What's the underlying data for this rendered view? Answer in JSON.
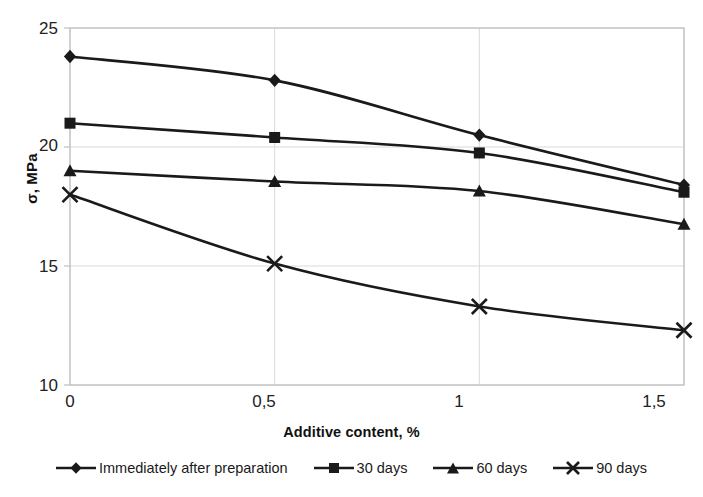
{
  "chart_data": {
    "type": "line",
    "title": "",
    "xlabel": "Additive content, %",
    "ylabel": "σ, MPa",
    "x": [
      0,
      0.5,
      1,
      1.5
    ],
    "xtick_labels": [
      "0",
      "0,5",
      "1",
      "1,5"
    ],
    "ytick_labels": [
      "10",
      "15",
      "20",
      "25"
    ],
    "yticks": [
      10,
      15,
      20,
      25
    ],
    "xlim": [
      0,
      1.5
    ],
    "ylim": [
      10,
      25
    ],
    "grid": true,
    "legend_position": "bottom",
    "series": [
      {
        "name": "Immediately after preparation",
        "marker": "diamond",
        "values": [
          23.8,
          22.8,
          20.5,
          18.4
        ]
      },
      {
        "name": "30 days",
        "marker": "square",
        "values": [
          21.0,
          20.4,
          19.75,
          18.1
        ]
      },
      {
        "name": "60 days",
        "marker": "triangle",
        "values": [
          19.0,
          18.55,
          18.15,
          16.75
        ]
      },
      {
        "name": "90 days",
        "marker": "x-cross",
        "values": [
          18.0,
          15.1,
          13.3,
          12.3
        ]
      }
    ],
    "colors": {
      "line": "#1a1a1a",
      "grid": "#d9d9d9",
      "axis": "#bfbfbf",
      "background": "#ffffff"
    }
  },
  "axes": {
    "y_title": "σ, MPa",
    "x_title": "Additive content, %",
    "y_tick_0": "10",
    "y_tick_1": "15",
    "y_tick_2": "20",
    "y_tick_3": "25",
    "x_tick_0": "0",
    "x_tick_1": "0,5",
    "x_tick_2": "1",
    "x_tick_3": "1,5"
  },
  "legend": {
    "items": [
      {
        "label": "Immediately after preparation",
        "marker": "diamond-marker-icon"
      },
      {
        "label": "30 days",
        "marker": "square-marker-icon"
      },
      {
        "label": "60 days",
        "marker": "triangle-marker-icon"
      },
      {
        "label": "90 days",
        "marker": "x-marker-icon"
      }
    ]
  }
}
